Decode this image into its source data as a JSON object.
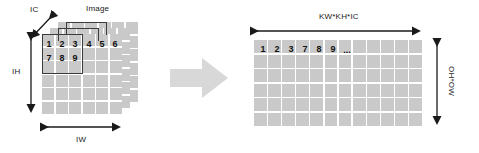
{
  "diagram": {
    "colors": {
      "cell_fill": "#c9c9c9",
      "grid_line": "#ffffff",
      "kernel_border": "#3c3c3c",
      "arrow_fill": "#d8d8d8",
      "text": "#1a1a1a",
      "background": "#ffffff"
    },
    "input": {
      "caption": "Image",
      "channel_label": "IC",
      "height_label": "IH",
      "width_label": "IW",
      "planes": 3,
      "grid_rows": 6,
      "grid_cols": 6,
      "kernel": {
        "rows": 2,
        "cols": 3
      },
      "visible_numbers_row1": [
        "1",
        "2",
        "3",
        "4",
        "5",
        "6"
      ],
      "visible_numbers_row2": [
        "7",
        "8",
        "9"
      ]
    },
    "transform": {
      "arrow_icon": "block-arrow-right"
    },
    "output": {
      "width_label": "KW*KH*IC",
      "height_label": "OH*OW",
      "grid_rows": 6,
      "grid_cols": 12,
      "first_row_values": [
        "1",
        "2",
        "3",
        "7",
        "8",
        "9",
        "..."
      ]
    }
  }
}
